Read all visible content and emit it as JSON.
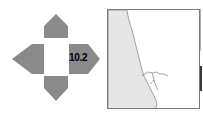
{
  "navigation": {
    "buttons": [
      {
        "direction": "up",
        "icon": "arrow-up-icon"
      },
      {
        "direction": "left",
        "icon": "arrow-left-icon"
      },
      {
        "direction": "right",
        "icon": "arrow-right-icon"
      },
      {
        "direction": "down",
        "icon": "arrow-down-icon"
      }
    ],
    "zoom_level": "10.2",
    "colors": {
      "arrow_fill": "#8a8a8a",
      "center": "#ffffff"
    }
  },
  "map": {
    "land_color": "#e6e6e6",
    "water_color": "#ffffff",
    "border_color": "#7a7a7a",
    "coastline_color": "#555555"
  }
}
